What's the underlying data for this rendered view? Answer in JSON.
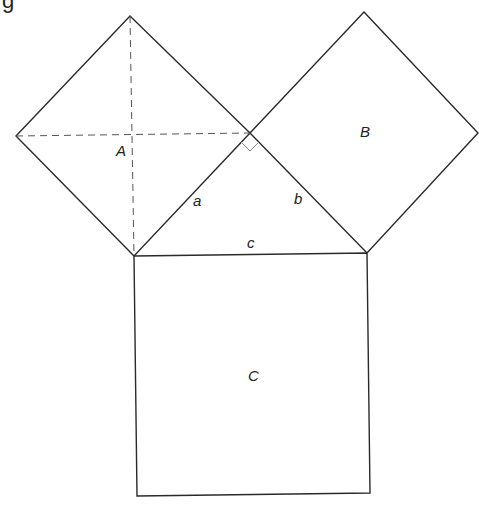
{
  "diagram": {
    "type": "pythagorean-theorem",
    "colors": {
      "stroke": "#2a2a2a",
      "dashed": "#555555",
      "right_angle": "#8a8a8a",
      "text": "#222222",
      "background": "#ffffff"
    },
    "cropped_caption_glyph": "g",
    "triangle": {
      "vertices": {
        "left": [
          134,
          256
        ],
        "right": [
          367,
          253
        ],
        "apex": [
          250,
          133
        ]
      },
      "side_labels": {
        "a": "a",
        "b": "b",
        "c": "c"
      }
    },
    "squares": [
      {
        "id": "A",
        "label": "A",
        "points": [
          [
            130,
            16
          ],
          [
            250,
            133
          ],
          [
            134,
            256
          ],
          [
            16,
            136
          ]
        ],
        "diagonals": true
      },
      {
        "id": "B",
        "label": "B",
        "points": [
          [
            364,
            12
          ],
          [
            478,
            133
          ],
          [
            367,
            253
          ],
          [
            250,
            133
          ]
        ],
        "diagonals": false
      },
      {
        "id": "C",
        "label": "C",
        "points": [
          [
            134,
            256
          ],
          [
            367,
            253
          ],
          [
            370,
            493
          ],
          [
            137,
            496
          ]
        ],
        "diagonals": false
      }
    ],
    "right_angle_marker": true
  }
}
